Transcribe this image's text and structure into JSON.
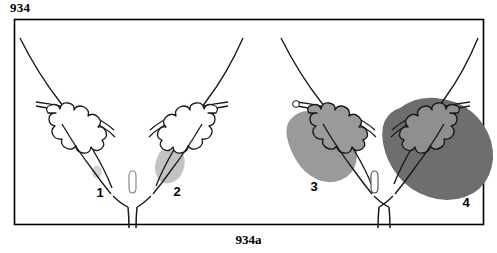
{
  "figure": {
    "number_top": "934",
    "caption_bottom": "934a",
    "type": "anatomical-line-diagram",
    "border_color": "#000000",
    "background_color": "#ffffff",
    "line_color": "#000000"
  },
  "panels": [
    {
      "label": "1",
      "label_x": 100,
      "label_y": 181,
      "stage": "minimal",
      "shade_color": "#c9c9c9",
      "shade_opacity": 0.75,
      "side": "left",
      "shade_description": "tiny faint gray dot low in the left wall"
    },
    {
      "label": "2",
      "label_x": 177,
      "label_y": 180,
      "stage": "localized",
      "shade_color": "#bdbdbd",
      "shade_opacity": 0.85,
      "side": "right-of-center-left-half",
      "shade_description": "small light gray oval blob inside the outline"
    },
    {
      "label": "3",
      "label_x": 314,
      "label_y": 175,
      "stage": "extensive",
      "shade_color": "#9a9a9a",
      "shade_opacity": 1,
      "side": "left-of-right-half",
      "shade_description": "medium gray region filling most of the structure"
    },
    {
      "label": "4",
      "label_x": 466,
      "label_y": 191,
      "stage": "advanced",
      "shade_color": "#6e6e6e",
      "shade_opacity": 1,
      "side": "right",
      "shade_description": "large dark gray mass extending well beyond the outline"
    }
  ],
  "structures": {
    "lobed_cluster_name": "scalloped-lobed-tissue",
    "central_os_name": "central-os-opening",
    "canal_wall_name": "canal-wall-line",
    "outer_wall_name": "outer-wall-curve"
  },
  "colors": {
    "ink": "#1a1a1a",
    "shade_light": "#c9c9c9",
    "shade_medium_light": "#bdbdbd",
    "shade_medium": "#9a9a9a",
    "shade_dark": "#6e6e6e",
    "frame": "#000000"
  }
}
